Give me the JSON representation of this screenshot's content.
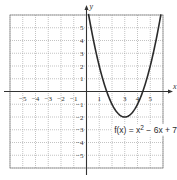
{
  "chart_data": {
    "type": "line",
    "title": "",
    "xlabel": "x",
    "ylabel": "y",
    "xlim": [
      -6,
      6
    ],
    "ylim": [
      -6,
      6
    ],
    "grid": true,
    "x_ticks": [
      -5,
      -4,
      -3,
      -2,
      -1,
      1,
      3,
      4,
      5
    ],
    "x_tick_labels": [
      "−5",
      "−4",
      "−3",
      "−2",
      "−1",
      "1",
      "3",
      "4",
      "5"
    ],
    "y_ticks": [
      5,
      4,
      3,
      2,
      1,
      -1,
      -2,
      -3,
      -4,
      -5
    ],
    "y_tick_labels": [
      "5",
      "4",
      "3",
      "2",
      "1",
      "−1",
      "−2",
      "−3",
      "−4",
      "−5"
    ],
    "series": [
      {
        "name": "f(x) = x^2 − 6x + 7",
        "function": {
          "a": 1,
          "b": -6,
          "c": 7
        },
        "x_range": [
          0,
          6.2
        ],
        "vertex": [
          3,
          -2
        ],
        "points": [
          [
            0,
            7
          ],
          [
            1,
            2
          ],
          [
            2,
            -1
          ],
          [
            3,
            -2
          ],
          [
            4,
            -1
          ],
          [
            5,
            2
          ],
          [
            6,
            7
          ]
        ]
      }
    ],
    "annotations": [
      {
        "text_parts": [
          "f(x) = x",
          "2",
          " − 6x + 7"
        ],
        "near": [
          3.5,
          -3
        ]
      }
    ],
    "colors": {
      "curve": "#2b2b2b",
      "grid": "#9a9a9a",
      "axis": "#333333"
    }
  }
}
